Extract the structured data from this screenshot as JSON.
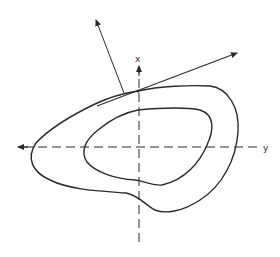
{
  "diagram": {
    "axes": {
      "vertical_label": "x",
      "horizontal_label": "y",
      "style": "dashed"
    },
    "curves": [
      {
        "name": "outer-contour"
      },
      {
        "name": "inner-contour"
      }
    ],
    "vectors": [
      {
        "name": "tangent-vector"
      },
      {
        "name": "normal-vector"
      }
    ],
    "colors": {
      "stroke": "#2a2a2a",
      "background": "#ffffff"
    }
  }
}
